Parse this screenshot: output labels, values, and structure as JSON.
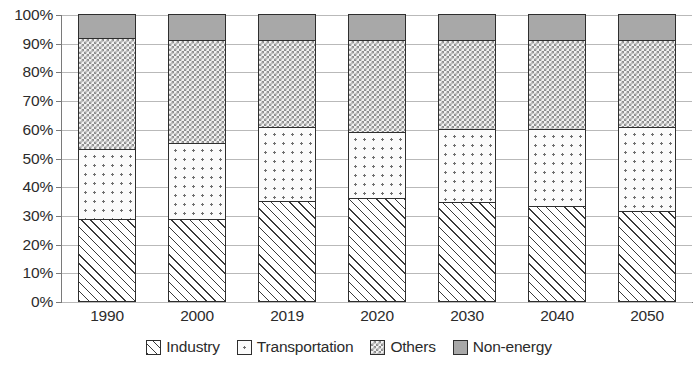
{
  "chart_data": {
    "type": "bar",
    "stacked": true,
    "normalized_percent": true,
    "title": "",
    "subtitle": "",
    "xlabel": "",
    "ylabel": "",
    "categories": [
      "1990",
      "2000",
      "2019",
      "2020",
      "2030",
      "2040",
      "2050"
    ],
    "series": [
      {
        "name": "Industry",
        "values": [
          28.5,
          28.5,
          35.0,
          36.0,
          34.5,
          33.0,
          31.5
        ],
        "pattern": "diagonal-hatch",
        "color": "#ffffff"
      },
      {
        "name": "Transportation",
        "values": [
          24.5,
          26.5,
          25.5,
          23.0,
          25.5,
          27.0,
          29.0
        ],
        "pattern": "sparse-dots",
        "color": "#fbfbfb"
      },
      {
        "name": "Others",
        "values": [
          38.5,
          36.0,
          30.5,
          32.0,
          31.0,
          31.0,
          30.5
        ],
        "pattern": "checkerboard",
        "color": "#f2f2f2"
      },
      {
        "name": "Non-energy",
        "values": [
          8.5,
          9.0,
          9.0,
          9.0,
          9.0,
          9.0,
          9.0
        ],
        "pattern": "solid-gray",
        "color": "#a8a8a8"
      }
    ],
    "cumulative_tops": {
      "Industry": [
        28.5,
        28.5,
        35.0,
        36.0,
        34.5,
        33.0,
        31.5
      ],
      "Transportation": [
        53.0,
        55.0,
        60.5,
        59.0,
        60.0,
        60.0,
        60.5
      ],
      "Others": [
        91.5,
        91.0,
        91.0,
        91.0,
        91.0,
        91.0,
        91.0
      ],
      "Non-energy": [
        100.0,
        100.0,
        100.0,
        100.0,
        100.0,
        100.0,
        100.0
      ]
    },
    "ylim": [
      0,
      100
    ],
    "ytick_values": [
      0,
      10,
      20,
      30,
      40,
      50,
      60,
      70,
      80,
      90,
      100
    ],
    "ytick_labels": [
      "0%",
      "10%",
      "20%",
      "30%",
      "40%",
      "50%",
      "60%",
      "70%",
      "80%",
      "90%",
      "100%"
    ],
    "grid": true,
    "grid_axis": "y",
    "legend_position": "bottom",
    "legend_entries": [
      "Industry",
      "Transportation",
      "Others",
      "Non-energy"
    ]
  }
}
